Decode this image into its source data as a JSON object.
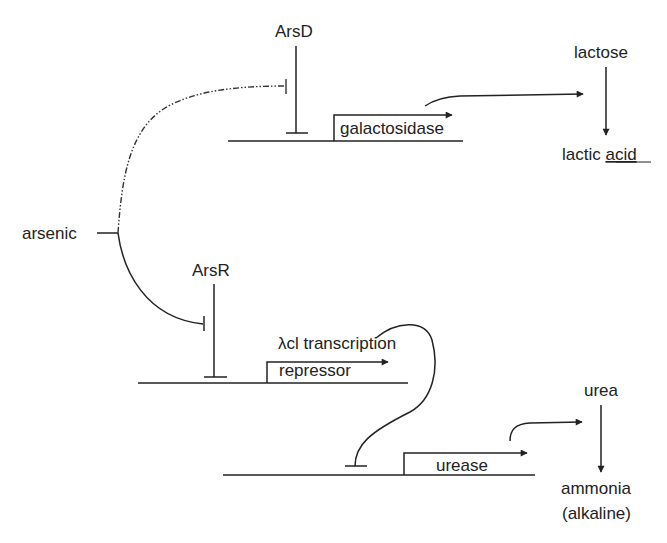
{
  "diagram": {
    "type": "genetic-circuit",
    "colors": {
      "line": "#222222",
      "background": "#ffffff"
    },
    "inputs": {
      "arsenic": {
        "label": "arsenic"
      }
    },
    "repressors": {
      "arsD": {
        "label": "ArsD"
      },
      "arsR": {
        "label": "ArsR"
      }
    },
    "genes": {
      "galactosidase": {
        "label": "galactosidase"
      },
      "lambda_repressor": {
        "label_line1": "λcl transcription",
        "label_line2": "repressor"
      },
      "urease": {
        "label": "urease"
      }
    },
    "reactions": {
      "lactose_pathway": {
        "substrate": "lactose",
        "product_word1": "lactic",
        "product_word2": "acid"
      },
      "urea_pathway": {
        "substrate": "urea",
        "product": "ammonia",
        "product_note": "(alkaline)"
      }
    },
    "edges": [
      {
        "from": "arsenic",
        "to": "ArsD",
        "type": "inhibition",
        "style": "dash-dot"
      },
      {
        "from": "arsenic",
        "to": "ArsR",
        "type": "inhibition",
        "style": "solid"
      },
      {
        "from": "ArsD",
        "to": "galactosidase promoter",
        "type": "inhibition"
      },
      {
        "from": "ArsR",
        "to": "λcl repressor promoter",
        "type": "inhibition"
      },
      {
        "from": "λcl transcription repressor",
        "to": "urease promoter",
        "type": "inhibition"
      },
      {
        "from": "galactosidase",
        "to": "lactose → lactic acid",
        "type": "activation"
      },
      {
        "from": "urease",
        "to": "urea → ammonia",
        "type": "activation"
      }
    ]
  }
}
